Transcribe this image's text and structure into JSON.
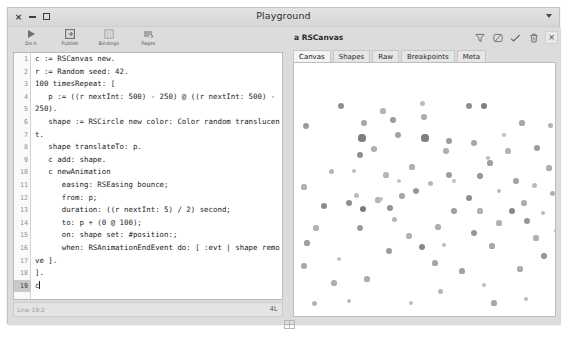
{
  "window": {
    "title": "Playground",
    "controls": [
      {
        "name": "close",
        "glyph": "×"
      },
      {
        "name": "minimize",
        "glyph": "–"
      },
      {
        "name": "maximize",
        "glyph": "□"
      }
    ],
    "menu_icon": "chevron-down-icon"
  },
  "toolbar": {
    "items": [
      {
        "label": "Do it",
        "icon": "play-icon"
      },
      {
        "label": "Publish",
        "icon": "publish-icon"
      },
      {
        "label": "Bindings",
        "icon": "bindings-icon"
      },
      {
        "label": "Pages",
        "icon": "pages-icon"
      }
    ]
  },
  "editor": {
    "lines": [
      {
        "n": "1",
        "text": "c := RSCanvas new."
      },
      {
        "n": "2",
        "text": "r := Random seed: 42."
      },
      {
        "n": "3",
        "text": ""
      },
      {
        "n": "4",
        "text": "100 timesRepeat: ["
      },
      {
        "n": "5",
        "text": "   p := ((r nextInt: 500) - 250) @ ((r nextInt: 500) -"
      },
      {
        "n": "5c",
        "text": "250).",
        "cont": true
      },
      {
        "n": "6",
        "text": "   shape := RSCircle new color: Color random translucen"
      },
      {
        "n": "6c",
        "text": "t.",
        "cont": true
      },
      {
        "n": "7",
        "text": "   shape translateTo: p."
      },
      {
        "n": "8",
        "text": ""
      },
      {
        "n": "9",
        "text": "   c add: shape."
      },
      {
        "n": "10",
        "text": ""
      },
      {
        "n": "11",
        "text": "   c newAnimation"
      },
      {
        "n": "12",
        "text": "      easing: RSEasing bounce;"
      },
      {
        "n": "13",
        "text": "      from: p;"
      },
      {
        "n": "14",
        "text": "      duration: ((r nextInt: 5) / 2) second;"
      },
      {
        "n": "15",
        "text": "      to: p + (0 @ 100);"
      },
      {
        "n": "16",
        "text": "      on: shape set: #position:;"
      },
      {
        "n": "17",
        "text": "      when: RSAnimationEndEvent do: [ :evt | shape remo"
      },
      {
        "n": "17c",
        "text": "ve ].",
        "cont": true
      },
      {
        "n": "18",
        "text": "]."
      },
      {
        "n": "19",
        "text": "c",
        "current": true
      }
    ]
  },
  "status": {
    "position": "Line 19:2",
    "indicator": "4L"
  },
  "inspector": {
    "title": "a RSCanvas",
    "icons": [
      {
        "name": "filter-icon"
      },
      {
        "name": "browse-icon"
      },
      {
        "name": "inspect-icon"
      },
      {
        "name": "trash-icon"
      },
      {
        "name": "close-icon",
        "glyph": "×"
      }
    ],
    "tabs": [
      {
        "label": "Canvas",
        "active": true
      },
      {
        "label": "Shapes",
        "active": false
      },
      {
        "label": "Raw",
        "active": false
      },
      {
        "label": "Breakpoints",
        "active": false
      },
      {
        "label": "Meta",
        "active": false
      }
    ]
  },
  "canvas": {
    "background": "#ffffff",
    "dots": [
      {
        "x": 12,
        "y": 63,
        "r": 3.0,
        "c": "#9a9a9a"
      },
      {
        "x": 47,
        "y": 43,
        "r": 3.2,
        "c": "#8f8f8f"
      },
      {
        "x": 70,
        "y": 60,
        "r": 3.0,
        "c": "#a5a5a5"
      },
      {
        "x": 68,
        "y": 75,
        "r": 3.6,
        "c": "#7d7d7d"
      },
      {
        "x": 89,
        "y": 48,
        "r": 2.6,
        "c": "#b2b2b2"
      },
      {
        "x": 99,
        "y": 57,
        "r": 3.0,
        "c": "#9a9a9a"
      },
      {
        "x": 104,
        "y": 72,
        "r": 3.0,
        "c": "#a2a2a2"
      },
      {
        "x": 80,
        "y": 86,
        "r": 2.8,
        "c": "#b0b0b0"
      },
      {
        "x": 66,
        "y": 92,
        "r": 3.0,
        "c": "#8f8f8f"
      },
      {
        "x": 92,
        "y": 112,
        "r": 2.6,
        "c": "#b5b5b5"
      },
      {
        "x": 130,
        "y": 54,
        "r": 2.7,
        "c": "#adadad"
      },
      {
        "x": 131,
        "y": 75,
        "r": 3.6,
        "c": "#7f7f7f"
      },
      {
        "x": 128,
        "y": 40,
        "r": 2.5,
        "c": "#bcbcbc"
      },
      {
        "x": 155,
        "y": 78,
        "r": 3.0,
        "c": "#9c9c9c"
      },
      {
        "x": 152,
        "y": 88,
        "r": 2.7,
        "c": "#b0b0b0"
      },
      {
        "x": 175,
        "y": 43,
        "r": 3.0,
        "c": "#8f8f8f"
      },
      {
        "x": 190,
        "y": 43,
        "r": 3.4,
        "c": "#7e7e7e"
      },
      {
        "x": 180,
        "y": 80,
        "r": 2.7,
        "c": "#a8a8a8"
      },
      {
        "x": 194,
        "y": 95,
        "r": 2.4,
        "c": "#bdbdbd"
      },
      {
        "x": 196,
        "y": 100,
        "r": 2.6,
        "c": "#9f9f9f"
      },
      {
        "x": 186,
        "y": 113,
        "r": 3.0,
        "c": "#959595"
      },
      {
        "x": 155,
        "y": 112,
        "r": 2.9,
        "c": "#9d9d9d"
      },
      {
        "x": 118,
        "y": 104,
        "r": 2.6,
        "c": "#b0b0b0"
      },
      {
        "x": 214,
        "y": 88,
        "r": 2.6,
        "c": "#b4b4b4"
      },
      {
        "x": 210,
        "y": 72,
        "r": 2.4,
        "c": "#bebebe"
      },
      {
        "x": 243,
        "y": 85,
        "r": 3.0,
        "c": "#9b9b9b"
      },
      {
        "x": 255,
        "y": 105,
        "r": 2.6,
        "c": "#aeaeae"
      },
      {
        "x": 10,
        "y": 124,
        "r": 2.6,
        "c": "#b0b0b0"
      },
      {
        "x": 30,
        "y": 143,
        "r": 3.2,
        "c": "#8c8c8c"
      },
      {
        "x": 22,
        "y": 165,
        "r": 2.6,
        "c": "#b2b2b2"
      },
      {
        "x": 13,
        "y": 180,
        "r": 2.6,
        "c": "#9f9f9f"
      },
      {
        "x": 10,
        "y": 203,
        "r": 2.8,
        "c": "#a8a8a8"
      },
      {
        "x": 55,
        "y": 140,
        "r": 3.0,
        "c": "#8f8f8f"
      },
      {
        "x": 62,
        "y": 132,
        "r": 2.5,
        "c": "#bababa"
      },
      {
        "x": 69,
        "y": 146,
        "r": 3.4,
        "c": "#7b7b7b"
      },
      {
        "x": 66,
        "y": 165,
        "r": 3.0,
        "c": "#9a9a9a"
      },
      {
        "x": 84,
        "y": 137,
        "r": 2.6,
        "c": "#b6b6b6"
      },
      {
        "x": 87,
        "y": 136,
        "r": 2.2,
        "c": "#c0c0c0"
      },
      {
        "x": 96,
        "y": 145,
        "r": 3.0,
        "c": "#949494"
      },
      {
        "x": 100,
        "y": 156,
        "r": 2.5,
        "c": "#b4b4b4"
      },
      {
        "x": 108,
        "y": 133,
        "r": 2.7,
        "c": "#a6a6a6"
      },
      {
        "x": 122,
        "y": 128,
        "r": 3.0,
        "c": "#9a9a9a"
      },
      {
        "x": 115,
        "y": 173,
        "r": 2.6,
        "c": "#b2b2b2"
      },
      {
        "x": 95,
        "y": 188,
        "r": 2.9,
        "c": "#9d9d9d"
      },
      {
        "x": 73,
        "y": 216,
        "r": 2.6,
        "c": "#acacac"
      },
      {
        "x": 117,
        "y": 240,
        "r": 2.4,
        "c": "#bfbfbf"
      },
      {
        "x": 128,
        "y": 184,
        "r": 3.2,
        "c": "#888888"
      },
      {
        "x": 144,
        "y": 164,
        "r": 2.6,
        "c": "#aeaeae"
      },
      {
        "x": 150,
        "y": 182,
        "r": 2.4,
        "c": "#bbbbbb"
      },
      {
        "x": 141,
        "y": 200,
        "r": 2.6,
        "c": "#a6a6a6"
      },
      {
        "x": 160,
        "y": 148,
        "r": 2.7,
        "c": "#a0a0a0"
      },
      {
        "x": 175,
        "y": 135,
        "r": 3.0,
        "c": "#8e8e8e"
      },
      {
        "x": 186,
        "y": 148,
        "r": 2.6,
        "c": "#b0b0b0"
      },
      {
        "x": 180,
        "y": 170,
        "r": 3.0,
        "c": "#969696"
      },
      {
        "x": 198,
        "y": 183,
        "r": 2.6,
        "c": "#a9a9a9"
      },
      {
        "x": 205,
        "y": 160,
        "r": 2.6,
        "c": "#b1b1b1"
      },
      {
        "x": 218,
        "y": 148,
        "r": 3.2,
        "c": "#8a8a8a"
      },
      {
        "x": 230,
        "y": 140,
        "r": 2.6,
        "c": "#aeaeae"
      },
      {
        "x": 233,
        "y": 158,
        "r": 3.0,
        "c": "#979797"
      },
      {
        "x": 242,
        "y": 175,
        "r": 2.6,
        "c": "#b0b0b0"
      },
      {
        "x": 249,
        "y": 150,
        "r": 2.4,
        "c": "#bcbcbc"
      },
      {
        "x": 240,
        "y": 122,
        "r": 2.5,
        "c": "#b8b8b8"
      },
      {
        "x": 222,
        "y": 118,
        "r": 2.7,
        "c": "#a4a4a4"
      },
      {
        "x": 250,
        "y": 193,
        "r": 3.0,
        "c": "#949494"
      },
      {
        "x": 226,
        "y": 206,
        "r": 2.6,
        "c": "#adadad"
      },
      {
        "x": 190,
        "y": 222,
        "r": 2.4,
        "c": "#bdbdbd"
      },
      {
        "x": 168,
        "y": 208,
        "r": 2.6,
        "c": "#a3a3a3"
      },
      {
        "x": 146,
        "y": 228,
        "r": 2.5,
        "c": "#b6b6b6"
      },
      {
        "x": 200,
        "y": 240,
        "r": 2.6,
        "c": "#a8a8a8"
      },
      {
        "x": 232,
        "y": 236,
        "r": 2.4,
        "c": "#bababa"
      },
      {
        "x": 45,
        "y": 196,
        "r": 2.4,
        "c": "#c0c0c0"
      },
      {
        "x": 40,
        "y": 220,
        "r": 2.6,
        "c": "#aeaeae"
      },
      {
        "x": 55,
        "y": 238,
        "r": 2.4,
        "c": "#bbbbbb"
      },
      {
        "x": 20,
        "y": 240,
        "r": 2.5,
        "c": "#b4b4b4"
      },
      {
        "x": 136,
        "y": 120,
        "r": 2.5,
        "c": "#b7b7b7"
      },
      {
        "x": 160,
        "y": 118,
        "r": 2.4,
        "c": "#c1c1c1"
      },
      {
        "x": 105,
        "y": 118,
        "r": 2.3,
        "c": "#c4c4c4"
      },
      {
        "x": 205,
        "y": 128,
        "r": 2.4,
        "c": "#bdbdbd"
      },
      {
        "x": 258,
        "y": 130,
        "r": 2.5,
        "c": "#b0b0b0"
      },
      {
        "x": 262,
        "y": 168,
        "r": 2.4,
        "c": "#b9b9b9"
      },
      {
        "x": 256,
        "y": 62,
        "r": 2.5,
        "c": "#b3b3b3"
      },
      {
        "x": 228,
        "y": 60,
        "r": 2.6,
        "c": "#a7a7a7"
      },
      {
        "x": 60,
        "y": 108,
        "r": 2.4,
        "c": "#bebebe"
      },
      {
        "x": 37,
        "y": 108,
        "r": 2.5,
        "c": "#b5b5b5"
      }
    ]
  }
}
